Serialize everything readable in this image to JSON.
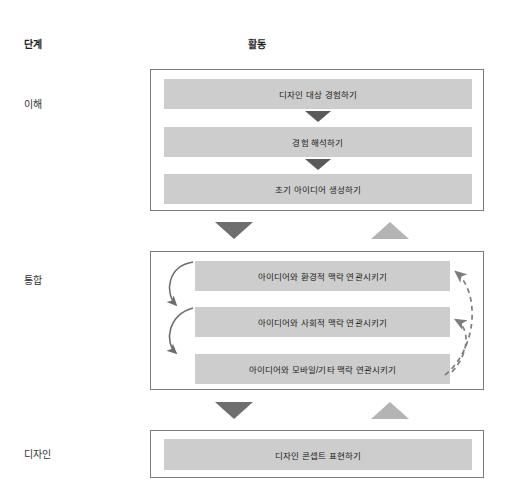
{
  "columns": {
    "stage_header": "단계",
    "activity_header": "활동"
  },
  "stages": [
    {
      "label": "이해"
    },
    {
      "label": "통합"
    },
    {
      "label": "디자인"
    }
  ],
  "groups": {
    "understand": {
      "activities": [
        "디자인 대상 경험하기",
        "경험 해석하기",
        "초기 아이디어 생성하기"
      ]
    },
    "integrate": {
      "activities": [
        "아이디어와 환경적 맥락 연관시키기",
        "아이디어와 사회적 맥락 연관시키기",
        "아이디어와 모바일/기타 맥락 연관시키기"
      ]
    },
    "design": {
      "activities": [
        "디자인 콘셉트 표현하기"
      ]
    }
  },
  "connectors": {
    "down_arrow_name": "forward-flow-arrow",
    "up_arrow_name": "feedback-flow-arrow",
    "left_curve_name": "sequential-curved-arrow",
    "right_dashed_name": "iteration-dashed-arrow"
  },
  "colors": {
    "bar_fill": "#cdcdcd",
    "group_border": "#7b7b7b",
    "arrow_dark": "#6e6e6e",
    "arrow_light": "#b4b4b4",
    "text": "#1a1a1a"
  }
}
